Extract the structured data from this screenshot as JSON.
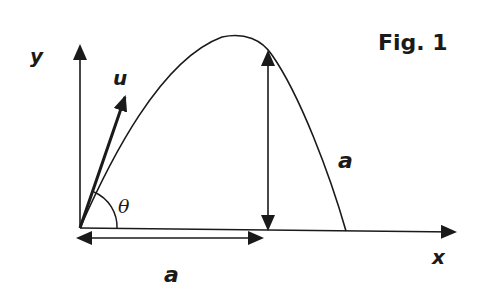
{
  "figure": {
    "title": "Fig. 1",
    "labels": {
      "y_axis": "y",
      "x_axis": "x",
      "velocity": "u",
      "angle": "θ",
      "horizontal_distance": "a",
      "max_height": "a"
    },
    "colors": {
      "ink": "#1a1a1a",
      "background": "#ffffff"
    }
  }
}
